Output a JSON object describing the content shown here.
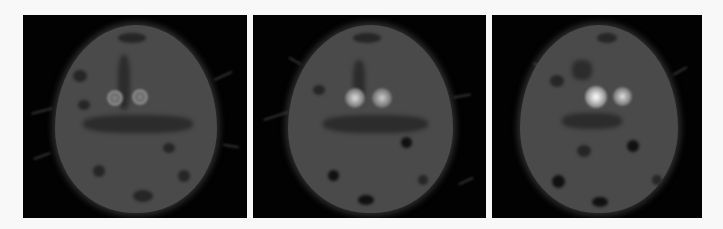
{
  "figure": {
    "background_color": "#f8f8f8",
    "panels": [
      {
        "index": 1,
        "bounds": {
          "x": 23,
          "y": 15,
          "w": 224,
          "h": 203
        },
        "head": {
          "cx": 112,
          "cy": 100,
          "rx": 80,
          "ry": 95
        },
        "spots": [
          {
            "cx": 92,
            "cy": 83,
            "r": 8,
            "style": "ring",
            "core": "#6e6e6e",
            "rim": "#8c8c8c"
          },
          {
            "cx": 117,
            "cy": 82,
            "r": 8,
            "style": "ring",
            "core": "#6e6e6e",
            "rim": "#8c8c8c"
          }
        ]
      },
      {
        "index": 2,
        "bounds": {
          "x": 253,
          "y": 15,
          "w": 233,
          "h": 203
        },
        "head": {
          "cx": 117,
          "cy": 100,
          "rx": 82,
          "ry": 95
        },
        "spots": [
          {
            "cx": 102,
            "cy": 83,
            "r": 9,
            "style": "glow",
            "core": "#d8d8d8",
            "rim": "#7a7a7a"
          },
          {
            "cx": 129,
            "cy": 83,
            "r": 9,
            "style": "glow",
            "core": "#c8c8c8",
            "rim": "#7a7a7a"
          }
        ]
      },
      {
        "index": 3,
        "bounds": {
          "x": 492,
          "y": 15,
          "w": 210,
          "h": 203
        },
        "head": {
          "cx": 105,
          "cy": 100,
          "rx": 78,
          "ry": 95
        },
        "spots": [
          {
            "cx": 104,
            "cy": 82,
            "r": 10,
            "style": "glow",
            "core": "#ffffff",
            "rim": "#8a8a8a"
          },
          {
            "cx": 130,
            "cy": 82,
            "r": 9,
            "style": "glow",
            "core": "#dcdcdc",
            "rim": "#7c7c7c"
          }
        ]
      }
    ]
  }
}
